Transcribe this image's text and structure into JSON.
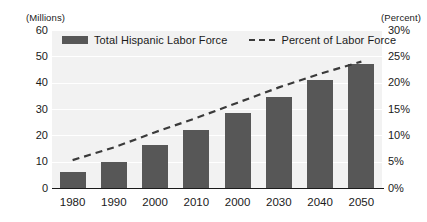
{
  "chart_data": {
    "type": "bar",
    "title": "",
    "subtitle": "",
    "xlabel": "",
    "ylabel": "(Millions)",
    "y2label": "(Percent)",
    "categories": [
      "1980",
      "1990",
      "2000",
      "2010",
      "2000",
      "2030",
      "2040",
      "2050"
    ],
    "grid": true,
    "legend_position": "top-left",
    "ylim": [
      0,
      60
    ],
    "y2lim": [
      0,
      30
    ],
    "yticks": [
      "60",
      "50",
      "40",
      "30",
      "20",
      "10",
      "0"
    ],
    "ytick_values": [
      60,
      50,
      40,
      30,
      20,
      10,
      0
    ],
    "y2ticks": [
      "30%",
      "25%",
      "20%",
      "15%",
      "10%",
      "5%",
      "0%"
    ],
    "y2tick_values": [
      30,
      25,
      20,
      15,
      10,
      5,
      0
    ],
    "series": [
      {
        "name": "Total Hispanic Labor Force",
        "type": "bar",
        "axis": "left",
        "unit": "millions",
        "color": "#575757",
        "values": [
          6,
          10,
          16.5,
          22,
          28.5,
          34.5,
          41,
          47
        ]
      },
      {
        "name": "Percent of Labor Force",
        "type": "line",
        "style": "dashed",
        "axis": "right",
        "unit": "percent",
        "color": "#3a3a3a",
        "values": [
          5.3,
          7.7,
          10.6,
          13.3,
          16.2,
          19.1,
          21.7,
          24.0
        ]
      }
    ]
  },
  "legend": {
    "items": [
      {
        "label": "Total Hispanic Labor Force",
        "marker": "bar-swatch"
      },
      {
        "label": "Percent of Labor Force",
        "marker": "dashed-line-swatch"
      }
    ]
  },
  "axes": {
    "left_unit_caption": "(Millions)",
    "right_unit_caption": "(Percent)"
  }
}
